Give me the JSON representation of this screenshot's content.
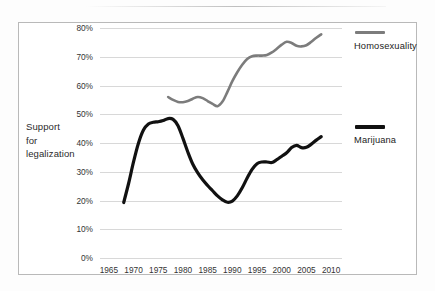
{
  "chart_data": {
    "type": "line",
    "title": "",
    "subtitle": "",
    "xlabel": "",
    "ylabel": "Support for legalization",
    "ylabel_lines": [
      "Support",
      "for",
      "legalization"
    ],
    "xlim": [
      1963,
      2012
    ],
    "ylim": [
      0,
      85
    ],
    "grid": true,
    "legend_position": "right",
    "y_tick_labels": [
      "80%",
      "70%",
      "60%",
      "50%",
      "40%",
      "30%",
      "20%",
      "10%",
      "0%"
    ],
    "y_tick_values": [
      80,
      70,
      60,
      50,
      40,
      30,
      20,
      10,
      0
    ],
    "x_tick_labels": [
      "1965",
      "1970",
      "1975",
      "1980",
      "1985",
      "1990",
      "1995",
      "2000",
      "2005",
      "2010"
    ],
    "x_tick_values": [
      1965,
      1970,
      1975,
      1980,
      1985,
      1990,
      1995,
      2000,
      2005,
      2010
    ],
    "series": [
      {
        "name": "Homosexuality",
        "color": "#7c7c7c",
        "x": [
          1977,
          1978,
          1979,
          1980,
          1981,
          1982,
          1983,
          1984,
          1985,
          1986,
          1987,
          1988,
          1989,
          1990,
          1991,
          1992,
          1993,
          1994,
          1995,
          1996,
          1997,
          1998,
          1999,
          2000,
          2001,
          2002,
          2003,
          2004,
          2005,
          2006,
          2007,
          2008
        ],
        "values": [
          56.0,
          55.0,
          54.3,
          54.2,
          54.6,
          55.4,
          56.0,
          55.6,
          54.6,
          53.6,
          52.8,
          54.4,
          57.8,
          61.5,
          64.6,
          67.2,
          69.2,
          70.2,
          70.4,
          70.4,
          70.6,
          71.5,
          72.8,
          74.2,
          75.2,
          74.8,
          73.8,
          73.6,
          74.0,
          75.2,
          76.6,
          77.8
        ]
      },
      {
        "name": "Marijuana",
        "color": "#111111",
        "x": [
          1968,
          1969,
          1970,
          1971,
          1972,
          1973,
          1974,
          1975,
          1976,
          1977,
          1978,
          1979,
          1980,
          1981,
          1982,
          1983,
          1984,
          1985,
          1986,
          1987,
          1988,
          1989,
          1990,
          1991,
          1992,
          1993,
          1994,
          1995,
          1996,
          1997,
          1998,
          1999,
          2000,
          2001,
          2002,
          2003,
          2004,
          2005,
          2006,
          2007,
          2008
        ],
        "values": [
          19.3,
          26.0,
          33.5,
          40.0,
          44.5,
          46.6,
          47.2,
          47.4,
          47.8,
          48.5,
          48.2,
          46.0,
          41.6,
          36.8,
          32.6,
          29.6,
          27.2,
          25.2,
          23.4,
          21.6,
          20.2,
          19.4,
          19.8,
          21.6,
          24.4,
          27.8,
          30.8,
          32.8,
          33.4,
          33.4,
          33.2,
          34.2,
          35.4,
          36.6,
          38.4,
          39.2,
          38.4,
          38.5,
          39.6,
          41.0,
          42.2
        ]
      }
    ]
  },
  "legend": {
    "items": [
      {
        "label": "Homosexuality",
        "color": "#7c7c7c"
      },
      {
        "label": "Marijuana",
        "color": "#111111"
      }
    ]
  }
}
